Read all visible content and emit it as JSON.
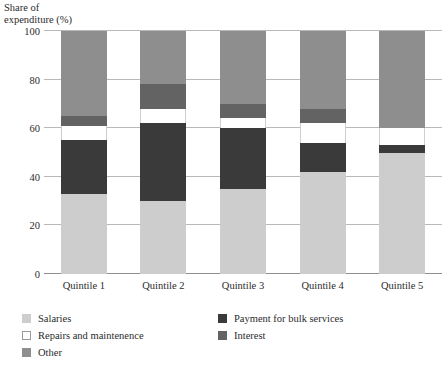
{
  "chart_data": {
    "type": "bar",
    "subtype": "stacked-bar-100",
    "title": "",
    "xlabel": "",
    "ylabel": "Share of\nexpenditure (%)",
    "ylim": [
      0,
      100
    ],
    "yticks": [
      0,
      20,
      40,
      60,
      80,
      100
    ],
    "ytick_labels": [
      "0",
      "20",
      "40",
      "60",
      "80",
      "100"
    ],
    "grid": true,
    "legend_position": "bottom-left",
    "categories": [
      "Quintile 1",
      "Quintile 2",
      "Quintile 3",
      "Quintile 4",
      "Quintile 5"
    ],
    "series": [
      {
        "name": "Salaries",
        "color": "#cdcdcd",
        "values": [
          33,
          30,
          35,
          42,
          50
        ]
      },
      {
        "name": "Payment for bulk services",
        "color": "#3a3a3a",
        "values": [
          22,
          32,
          25,
          12,
          3
        ]
      },
      {
        "name": "Repairs and maintenence",
        "color": "#ffffff",
        "values": [
          6,
          6,
          4,
          8,
          7
        ]
      },
      {
        "name": "Interest",
        "color": "#636363",
        "values": [
          4,
          10,
          6,
          6,
          0
        ]
      },
      {
        "name": "Other",
        "color": "#8e8e8e",
        "values": [
          35,
          22,
          30,
          32,
          40
        ]
      }
    ]
  },
  "caption": {
    "text": ""
  }
}
